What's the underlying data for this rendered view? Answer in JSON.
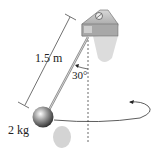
{
  "diagram": {
    "type": "conical-pendulum",
    "labels": {
      "length": "1.5 m",
      "angle": "30°",
      "mass": "2 kg"
    },
    "colors": {
      "line": "#333333",
      "mount": "#9a9a9a",
      "shadow": "#d4d4d4"
    }
  }
}
